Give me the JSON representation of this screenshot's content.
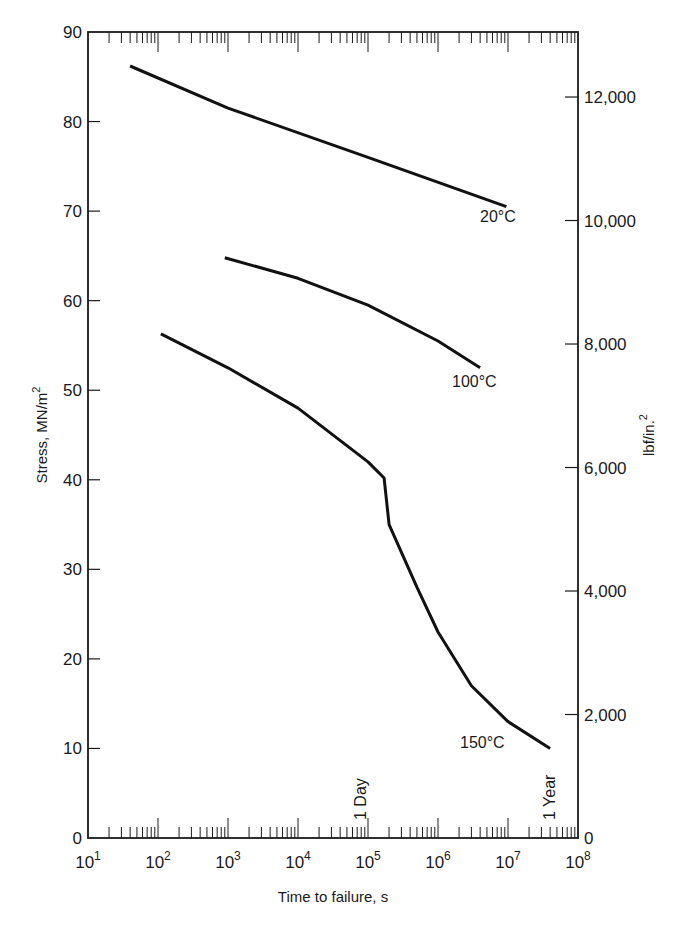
{
  "chart_data": {
    "type": "line",
    "title": "",
    "xlabel": "Time to failure, s",
    "ylabel": "Stress, MN/m²",
    "y2label": "lbf/in.²",
    "xscale": "log",
    "xlim": [
      10,
      100000000
    ],
    "ylim": [
      0,
      90
    ],
    "y2lim": [
      0,
      13053
    ],
    "grid": false,
    "x_ticks": [
      {
        "base": "10",
        "exp": "1",
        "value": 10
      },
      {
        "base": "10",
        "exp": "2",
        "value": 100
      },
      {
        "base": "10",
        "exp": "3",
        "value": 1000
      },
      {
        "base": "10",
        "exp": "4",
        "value": 10000
      },
      {
        "base": "10",
        "exp": "5",
        "value": 100000
      },
      {
        "base": "10",
        "exp": "6",
        "value": 1000000
      },
      {
        "base": "10",
        "exp": "7",
        "value": 10000000
      },
      {
        "base": "10",
        "exp": "8",
        "value": 100000000
      }
    ],
    "y_ticks": [
      "0",
      "10",
      "20",
      "30",
      "40",
      "50",
      "60",
      "70",
      "80",
      "90"
    ],
    "y2_ticks": [
      {
        "label": "0",
        "value": 0
      },
      {
        "label": "2,000",
        "value": 2000
      },
      {
        "label": "4,000",
        "value": 4000
      },
      {
        "label": "6,000",
        "value": 6000
      },
      {
        "label": "8,000",
        "value": 8000
      },
      {
        "label": "10,000",
        "value": 10000
      },
      {
        "label": "12,000",
        "value": 12000
      }
    ],
    "annotations": [
      {
        "text": "1 Day",
        "x": 86400,
        "orientation": "vertical"
      },
      {
        "text": "1 Year",
        "x": 31536000,
        "orientation": "vertical"
      }
    ],
    "series": [
      {
        "name": "20°C",
        "x": [
          40,
          1000,
          100000,
          9500000
        ],
        "y": [
          86.2,
          81.5,
          76.0,
          70.5
        ]
      },
      {
        "name": "100°C",
        "x": [
          900,
          10000,
          100000,
          1000000,
          4000000
        ],
        "y": [
          64.8,
          62.5,
          59.5,
          55.5,
          52.5
        ]
      },
      {
        "name": "150°C",
        "x": [
          110,
          1000,
          10000,
          100000,
          170000,
          200000,
          500000,
          1000000,
          3000000,
          10000000,
          40000000
        ],
        "y": [
          56.3,
          52.5,
          48.0,
          42.0,
          40.2,
          35.0,
          28.0,
          23.0,
          17.0,
          13.0,
          10.0
        ]
      }
    ]
  },
  "labels": {
    "curve_20": "20°C",
    "curve_100": "100°C",
    "curve_150": "150°C",
    "one_day": "1 Day",
    "one_year": "1 Year",
    "x_title": "Time to failure, s",
    "y_title_main": "Stress, MN/m",
    "y_title_sup": "2",
    "y2_title_main": "lbf/in.",
    "y2_title_sup": "2"
  }
}
